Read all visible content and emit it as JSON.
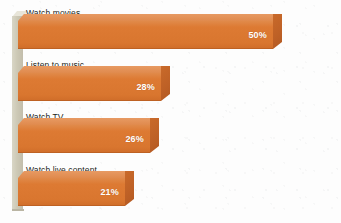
{
  "chart_data": {
    "type": "bar",
    "orientation": "horizontal",
    "title": "",
    "subtitle": "",
    "xlabel": "",
    "ylabel": "",
    "categories": [
      "Watch movies",
      "Listen to music",
      "Watch TV",
      "Watch live content"
    ],
    "values": [
      50,
      28,
      26,
      21
    ],
    "value_labels": [
      "50%",
      "28%",
      "26%",
      "21%"
    ],
    "unit": "%",
    "xlim": [
      0,
      55
    ],
    "grid": false,
    "legend": false,
    "legend_position": "none",
    "style": "3d-horizontal-bars",
    "colors": {
      "bar_front": "#dd7a33",
      "bar_top": "#e79a63",
      "bar_side": "#c0672a",
      "axis_wall": "#cdc9b6",
      "background": "#fdfdfd",
      "label_text": "#231f20",
      "value_text": "#ffffff"
    }
  },
  "chart": {
    "bars": [
      {
        "label": "Watch movies",
        "value": 50,
        "value_label": "50%"
      },
      {
        "label": "Listen to music",
        "value": 28,
        "value_label": "28%"
      },
      {
        "label": "Watch TV",
        "value": 26,
        "value_label": "26%"
      },
      {
        "label": "Watch live content",
        "value": 21,
        "value_label": "21%"
      }
    ]
  }
}
